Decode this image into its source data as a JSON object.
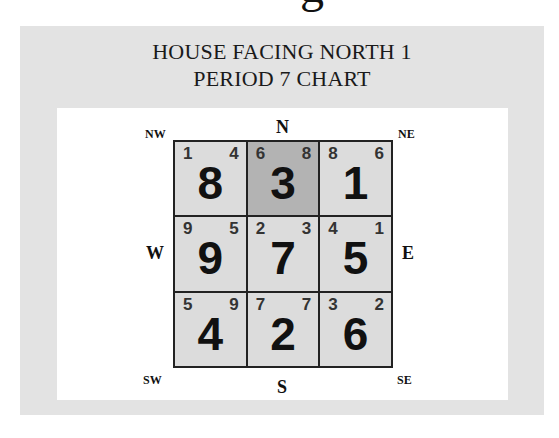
{
  "partial_glyph": "g",
  "title": {
    "line1": "HOUSE FACING NORTH 1",
    "line2": "PERIOD 7 CHART"
  },
  "directions": {
    "N": "N",
    "S": "S",
    "E": "E",
    "W": "W",
    "NE": "NE",
    "NW": "NW",
    "SE": "SE",
    "SW": "SW"
  },
  "colors": {
    "frame": "#e3e3e3",
    "cell": "#dcdcdc",
    "highlight_cell": "#b3b3b3",
    "grid_line": "#222222"
  },
  "grid": {
    "rows": [
      [
        {
          "position": "NW",
          "mountain": "1",
          "water": "4",
          "base": "8",
          "highlight": false
        },
        {
          "position": "N",
          "mountain": "6",
          "water": "8",
          "base": "3",
          "highlight": true
        },
        {
          "position": "NE",
          "mountain": "8",
          "water": "6",
          "base": "1",
          "highlight": false
        }
      ],
      [
        {
          "position": "W",
          "mountain": "9",
          "water": "5",
          "base": "9",
          "highlight": false
        },
        {
          "position": "C",
          "mountain": "2",
          "water": "3",
          "base": "7",
          "highlight": false
        },
        {
          "position": "E",
          "mountain": "4",
          "water": "1",
          "base": "5",
          "highlight": false
        }
      ],
      [
        {
          "position": "SW",
          "mountain": "5",
          "water": "9",
          "base": "4",
          "highlight": false
        },
        {
          "position": "S",
          "mountain": "7",
          "water": "7",
          "base": "2",
          "highlight": false
        },
        {
          "position": "SE",
          "mountain": "3",
          "water": "2",
          "base": "6",
          "highlight": false
        }
      ]
    ]
  }
}
